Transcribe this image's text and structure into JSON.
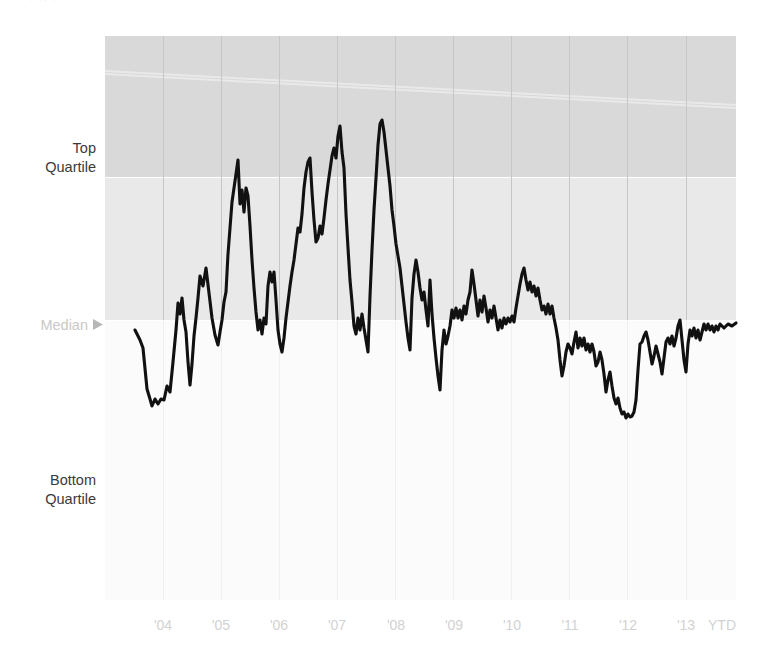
{
  "figure": {
    "top_caption_remnant": "· ·· ·",
    "background_color": "#ffffff",
    "width": 764,
    "height": 669
  },
  "axis": {
    "y_labels": [
      {
        "id": "top-quartile",
        "line1": "Top",
        "line2": "Quartile",
        "color": "#3a3a3a"
      },
      {
        "id": "median",
        "line1": "Median",
        "line2": "",
        "color": "#c9c9c9",
        "marker": "triangle-right"
      },
      {
        "id": "bottom-quartile",
        "line1": "Bottom",
        "line2": "Quartile",
        "color": "#3a3a3a"
      }
    ],
    "x_tick_labels": [
      "'04",
      "'05",
      "'06",
      "'07",
      "'08",
      "'09",
      "'10",
      "'11",
      "'12",
      "'13",
      "YTD"
    ]
  },
  "bands": {
    "top_quartile_band_color": "#d9d9d9",
    "median_band_color": "#e9e9e9",
    "lower_band_color": "#fbfbfb",
    "gridline_color": "#c6c6c6",
    "lower_gridline_color": "#f0f0f0"
  },
  "series_style": {
    "color": "#111111",
    "width": 3.1
  },
  "chart_data": {
    "type": "line",
    "title": "",
    "subtitle": "",
    "xlabel": "",
    "ylabel": "",
    "grid": true,
    "legend": false,
    "y_axis_type": "percentile-rank",
    "y_reference_bands": [
      {
        "name": "Above Top Quartile",
        "from": 75,
        "to": 100,
        "shade": "#d9d9d9"
      },
      {
        "name": "Median to Top Quartile",
        "from": 50,
        "to": 75,
        "shade": "#e9e9e9"
      },
      {
        "name": "Below Median",
        "from": 0,
        "to": 50,
        "shade": "#fbfbfb"
      }
    ],
    "y_reference_lines": [
      {
        "label": "Top Quartile",
        "value": 75
      },
      {
        "label": "Median",
        "value": 50
      },
      {
        "label": "Bottom Quartile",
        "value": 25
      }
    ],
    "ylim": [
      0,
      100
    ],
    "categories": [
      "'04",
      "'05",
      "'06",
      "'07",
      "'08",
      "'09",
      "'10",
      "'11",
      "'12",
      "'13",
      "YTD"
    ],
    "x_tick_values": [
      2004,
      2005,
      2006,
      2007,
      2008,
      2009,
      2010,
      2011,
      2012,
      2013,
      2014
    ],
    "series": [
      {
        "name": "Percentile Rank",
        "points": [
          [
            135,
            330
          ],
          [
            140,
            340
          ],
          [
            143,
            348
          ],
          [
            147,
            389
          ],
          [
            150,
            399
          ],
          [
            152,
            406
          ],
          [
            155,
            399
          ],
          [
            158,
            404
          ],
          [
            161,
            399
          ],
          [
            164,
            400
          ],
          [
            167,
            386
          ],
          [
            170,
            392
          ],
          [
            173,
            362
          ],
          [
            176,
            330
          ],
          [
            178,
            303
          ],
          [
            180,
            314
          ],
          [
            182,
            298
          ],
          [
            184,
            320
          ],
          [
            186,
            332
          ],
          [
            188,
            362
          ],
          [
            190,
            385
          ],
          [
            192,
            364
          ],
          [
            194,
            336
          ],
          [
            196,
            318
          ],
          [
            198,
            298
          ],
          [
            200,
            276
          ],
          [
            203,
            286
          ],
          [
            206,
            268
          ],
          [
            209,
            293
          ],
          [
            212,
            318
          ],
          [
            215,
            335
          ],
          [
            218,
            345
          ],
          [
            220,
            332
          ],
          [
            222,
            320
          ],
          [
            224,
            302
          ],
          [
            226,
            292
          ],
          [
            228,
            254
          ],
          [
            230,
            228
          ],
          [
            232,
            202
          ],
          [
            234,
            188
          ],
          [
            236,
            174
          ],
          [
            238,
            160
          ],
          [
            240,
            204
          ],
          [
            242,
            190
          ],
          [
            244,
            212
          ],
          [
            246,
            188
          ],
          [
            248,
            196
          ],
          [
            250,
            226
          ],
          [
            252,
            260
          ],
          [
            254,
            288
          ],
          [
            256,
            312
          ],
          [
            258,
            330
          ],
          [
            260,
            320
          ],
          [
            262,
            334
          ],
          [
            264,
            318
          ],
          [
            266,
            324
          ],
          [
            268,
            286
          ],
          [
            270,
            272
          ],
          [
            272,
            282
          ],
          [
            274,
            272
          ],
          [
            276,
            300
          ],
          [
            278,
            330
          ],
          [
            280,
            344
          ],
          [
            282,
            352
          ],
          [
            284,
            338
          ],
          [
            286,
            318
          ],
          [
            288,
            302
          ],
          [
            290,
            286
          ],
          [
            292,
            272
          ],
          [
            294,
            260
          ],
          [
            296,
            244
          ],
          [
            298,
            228
          ],
          [
            300,
            232
          ],
          [
            302,
            214
          ],
          [
            304,
            188
          ],
          [
            306,
            172
          ],
          [
            308,
            162
          ],
          [
            310,
            158
          ],
          [
            312,
            192
          ],
          [
            314,
            220
          ],
          [
            316,
            242
          ],
          [
            318,
            238
          ],
          [
            320,
            226
          ],
          [
            322,
            234
          ],
          [
            324,
            218
          ],
          [
            326,
            200
          ],
          [
            328,
            184
          ],
          [
            330,
            170
          ],
          [
            332,
            156
          ],
          [
            334,
            148
          ],
          [
            336,
            158
          ],
          [
            338,
            136
          ],
          [
            340,
            126
          ],
          [
            342,
            152
          ],
          [
            344,
            168
          ],
          [
            346,
            214
          ],
          [
            348,
            248
          ],
          [
            350,
            280
          ],
          [
            352,
            302
          ],
          [
            354,
            326
          ],
          [
            356,
            334
          ],
          [
            358,
            318
          ],
          [
            360,
            330
          ],
          [
            362,
            314
          ],
          [
            364,
            328
          ],
          [
            366,
            340
          ],
          [
            368,
            352
          ],
          [
            370,
            296
          ],
          [
            372,
            250
          ],
          [
            374,
            210
          ],
          [
            376,
            178
          ],
          [
            378,
            145
          ],
          [
            380,
            124
          ],
          [
            382,
            120
          ],
          [
            384,
            132
          ],
          [
            386,
            150
          ],
          [
            388,
            168
          ],
          [
            390,
            186
          ],
          [
            392,
            210
          ],
          [
            394,
            226
          ],
          [
            396,
            244
          ],
          [
            398,
            256
          ],
          [
            400,
            268
          ],
          [
            402,
            286
          ],
          [
            404,
            304
          ],
          [
            406,
            322
          ],
          [
            408,
            338
          ],
          [
            410,
            350
          ],
          [
            412,
            298
          ],
          [
            414,
            274
          ],
          [
            416,
            260
          ],
          [
            418,
            272
          ],
          [
            420,
            288
          ],
          [
            422,
            300
          ],
          [
            424,
            292
          ],
          [
            426,
            310
          ],
          [
            428,
            326
          ],
          [
            430,
            280
          ],
          [
            432,
            314
          ],
          [
            434,
            338
          ],
          [
            436,
            358
          ],
          [
            438,
            376
          ],
          [
            440,
            390
          ],
          [
            442,
            350
          ],
          [
            444,
            330
          ],
          [
            446,
            344
          ],
          [
            448,
            336
          ],
          [
            450,
            326
          ],
          [
            452,
            310
          ],
          [
            454,
            318
          ],
          [
            456,
            308
          ],
          [
            458,
            318
          ],
          [
            460,
            310
          ],
          [
            462,
            320
          ],
          [
            464,
            306
          ],
          [
            466,
            314
          ],
          [
            468,
            300
          ],
          [
            470,
            292
          ],
          [
            472,
            270
          ],
          [
            474,
            284
          ],
          [
            476,
            300
          ],
          [
            478,
            316
          ],
          [
            480,
            300
          ],
          [
            482,
            312
          ],
          [
            484,
            296
          ],
          [
            486,
            308
          ],
          [
            488,
            322
          ],
          [
            490,
            310
          ],
          [
            492,
            318
          ],
          [
            494,
            306
          ],
          [
            496,
            318
          ],
          [
            498,
            330
          ],
          [
            500,
            320
          ],
          [
            502,
            328
          ],
          [
            504,
            318
          ],
          [
            506,
            324
          ],
          [
            508,
            318
          ],
          [
            510,
            322
          ],
          [
            512,
            316
          ],
          [
            514,
            322
          ],
          [
            516,
            308
          ],
          [
            518,
            296
          ],
          [
            520,
            284
          ],
          [
            522,
            274
          ],
          [
            524,
            268
          ],
          [
            526,
            280
          ],
          [
            528,
            290
          ],
          [
            530,
            282
          ],
          [
            532,
            292
          ],
          [
            534,
            286
          ],
          [
            536,
            296
          ],
          [
            538,
            288
          ],
          [
            540,
            300
          ],
          [
            542,
            310
          ],
          [
            544,
            306
          ],
          [
            546,
            314
          ],
          [
            548,
            304
          ],
          [
            550,
            314
          ],
          [
            552,
            306
          ],
          [
            554,
            318
          ],
          [
            556,
            328
          ],
          [
            558,
            340
          ],
          [
            560,
            360
          ],
          [
            562,
            376
          ],
          [
            564,
            366
          ],
          [
            566,
            352
          ],
          [
            568,
            344
          ],
          [
            570,
            348
          ],
          [
            572,
            354
          ],
          [
            574,
            342
          ],
          [
            576,
            332
          ],
          [
            578,
            348
          ],
          [
            580,
            338
          ],
          [
            582,
            346
          ],
          [
            584,
            338
          ],
          [
            586,
            350
          ],
          [
            588,
            344
          ],
          [
            590,
            352
          ],
          [
            592,
            344
          ],
          [
            594,
            352
          ],
          [
            596,
            366
          ],
          [
            598,
            362
          ],
          [
            600,
            352
          ],
          [
            602,
            360
          ],
          [
            604,
            374
          ],
          [
            606,
            392
          ],
          [
            608,
            380
          ],
          [
            610,
            372
          ],
          [
            612,
            386
          ],
          [
            614,
            398
          ],
          [
            616,
            404
          ],
          [
            618,
            398
          ],
          [
            620,
            408
          ],
          [
            622,
            414
          ],
          [
            624,
            412
          ],
          [
            626,
            418
          ],
          [
            628,
            414
          ],
          [
            630,
            417
          ],
          [
            632,
            416
          ],
          [
            634,
            412
          ],
          [
            636,
            400
          ],
          [
            638,
            370
          ],
          [
            640,
            344
          ],
          [
            642,
            342
          ],
          [
            644,
            336
          ],
          [
            646,
            332
          ],
          [
            648,
            340
          ],
          [
            650,
            352
          ],
          [
            652,
            364
          ],
          [
            654,
            356
          ],
          [
            656,
            346
          ],
          [
            658,
            354
          ],
          [
            660,
            362
          ],
          [
            662,
            374
          ],
          [
            664,
            358
          ],
          [
            666,
            342
          ],
          [
            668,
            338
          ],
          [
            670,
            344
          ],
          [
            672,
            336
          ],
          [
            674,
            346
          ],
          [
            676,
            338
          ],
          [
            678,
            326
          ],
          [
            680,
            320
          ],
          [
            682,
            340
          ],
          [
            684,
            360
          ],
          [
            686,
            372
          ],
          [
            688,
            344
          ],
          [
            690,
            330
          ],
          [
            692,
            336
          ],
          [
            694,
            328
          ],
          [
            696,
            338
          ],
          [
            698,
            330
          ],
          [
            700,
            340
          ],
          [
            702,
            332
          ],
          [
            704,
            324
          ],
          [
            706,
            330
          ],
          [
            708,
            324
          ],
          [
            710,
            330
          ],
          [
            712,
            326
          ],
          [
            714,
            332
          ],
          [
            716,
            326
          ],
          [
            718,
            330
          ],
          [
            720,
            324
          ],
          [
            724,
            328
          ],
          [
            728,
            324
          ],
          [
            732,
            326
          ],
          [
            736,
            323
          ]
        ],
        "color": "#111111"
      }
    ],
    "plot_area": {
      "x0": 105,
      "y0": 36,
      "x1": 736,
      "y1": 600
    },
    "band_boundaries_px": {
      "top_quartile": 177,
      "median": 320
    }
  }
}
